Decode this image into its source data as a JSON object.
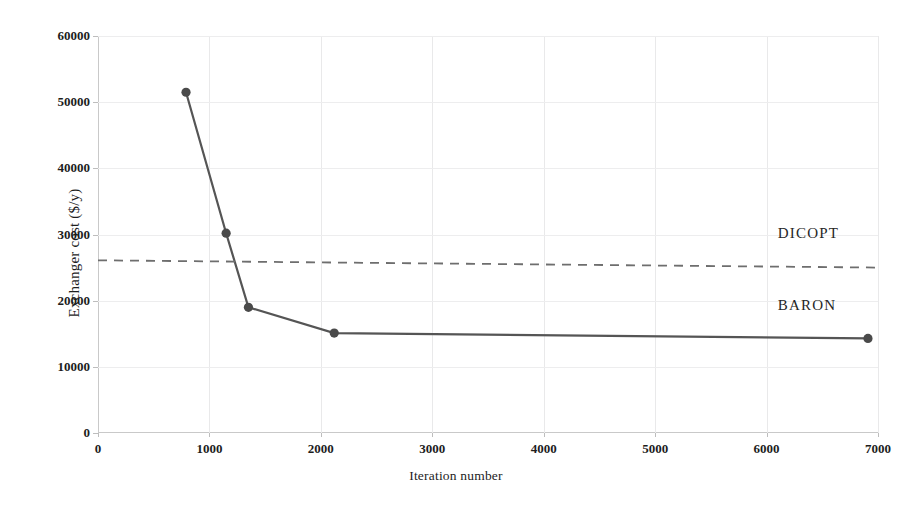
{
  "figure": {
    "top_caption_fragment": "",
    "background": "#ffffff"
  },
  "chart_data": {
    "type": "line",
    "title": "",
    "xlabel": "Iteration number",
    "ylabel": "Exchanger cost ($/y)",
    "xlim": [
      0,
      7000
    ],
    "ylim": [
      0,
      60000
    ],
    "xticks": [
      0,
      1000,
      2000,
      3000,
      4000,
      5000,
      6000,
      7000
    ],
    "xtick_labels": [
      "0",
      "1000",
      "2000",
      "3000",
      "4000",
      "5000",
      "6000",
      "7000"
    ],
    "yticks": [
      0,
      10000,
      20000,
      30000,
      40000,
      50000,
      60000
    ],
    "ytick_labels": [
      "0",
      "10000",
      "20000",
      "30000",
      "40000",
      "50000",
      "60000"
    ],
    "grid": true,
    "legend_position": "inline-annotation",
    "series": [
      {
        "name": "BARON",
        "style": "solid",
        "color": "#555555",
        "marker": "circle",
        "marker_color": "#4a4a4a",
        "label_x": 6100,
        "label_y": 19200,
        "x": [
          790,
          1150,
          1350,
          2120,
          6910
        ],
        "y": [
          51500,
          30200,
          19000,
          15100,
          14300
        ]
      },
      {
        "name": "DICOPT",
        "style": "dashed",
        "color": "#6e6e6e",
        "marker": "none",
        "label_x": 6100,
        "label_y": 30100,
        "x": [
          0,
          7000
        ],
        "y": [
          26100,
          25000
        ]
      }
    ]
  },
  "annotations": {
    "dicopt_label": "DICOPT",
    "baron_label": "BARON"
  }
}
